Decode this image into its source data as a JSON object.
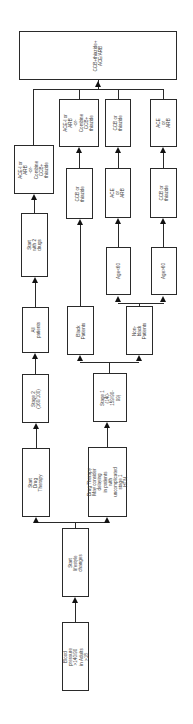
{
  "diagram": {
    "orientation": "rotated-90-ccw",
    "line_color": "#2a2a2a",
    "nodes": {
      "blood_pressure": "Blood pressure\n>140/90 in Adults >18",
      "lifestyle": "Start lifestyle changes",
      "start_drug_therapy": "Start Drug Therapy",
      "drug_therapy_stage1": "Drug Therapy\nMay consider delaying\nin patients with\nuncomplicated stage 1\nHTN",
      "stage2": "Stage 2\n(160/100)",
      "stage1": "Stage 1\n(140-159/90-\n99)",
      "all_patients": "All patients",
      "black_patients": "Black Patients",
      "nonblack_patients": "Non-black\nPatients",
      "start_two_drugs": "Start with 2 drugs",
      "ace_arb_combo_left": "ACE-I or ARB\n-or-\nCombine\nCCB+\nthiazide",
      "ccb_thiazide_black": "CCB or thiazide",
      "age_lt60": "Age<60",
      "age_gt60": "Age>60",
      "ace_arb_lt60": "ACE or ARB",
      "ccb_thiazide_gt60": "CCB or thiazide",
      "ace_arb_combo_black": "ACE-I or ARB\n-or-\nCombine\nCCB+\nthiazide",
      "ccb_thiazide_lt60": "CCB or thiazide",
      "ace_arb_gt60": "ACE or ARB",
      "final": "CCB+thiazide+\nACE/ARB"
    }
  }
}
